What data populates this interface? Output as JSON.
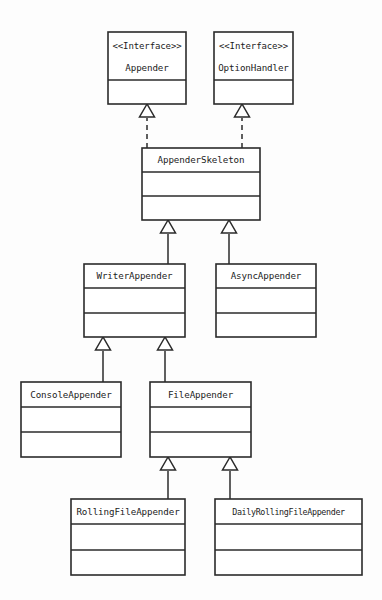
{
  "diagram": {
    "type": "uml-class-diagram",
    "background_color": "#fdfdfd",
    "stroke_color": "#2b2b2b",
    "fill_color": "#ffffff",
    "stereotype_text": "<<Interface>>",
    "nodes": [
      {
        "id": "appender",
        "name": "Appender",
        "kind": "interface",
        "stereotype": "<<Interface>>",
        "x": 108,
        "y": 32,
        "w": 78,
        "h": 72,
        "dividers": [
          48
        ],
        "title_y": 46,
        "name_y": 68
      },
      {
        "id": "option-handler",
        "name": "OptionHandler",
        "kind": "interface",
        "stereotype": "<<Interface>>",
        "x": 214,
        "y": 32,
        "w": 79,
        "h": 72,
        "dividers": [
          48
        ],
        "title_y": 46,
        "name_y": 68
      },
      {
        "id": "appender-skeleton",
        "name": "AppenderSkeleton",
        "kind": "class",
        "stereotype": "",
        "x": 142,
        "y": 148,
        "w": 118,
        "h": 72,
        "dividers": [
          24,
          48
        ],
        "title_y": 160,
        "name_y": 160
      },
      {
        "id": "writer-appender",
        "name": "WriterAppender",
        "kind": "class",
        "stereotype": "",
        "x": 84,
        "y": 264,
        "w": 101,
        "h": 73,
        "dividers": [
          24,
          49
        ],
        "title_y": 276,
        "name_y": 276
      },
      {
        "id": "async-appender",
        "name": "AsyncAppender",
        "kind": "class",
        "stereotype": "",
        "x": 216,
        "y": 264,
        "w": 100,
        "h": 73,
        "dividers": [
          24,
          49
        ],
        "title_y": 276,
        "name_y": 276
      },
      {
        "id": "console-appender",
        "name": "ConsoleAppender",
        "kind": "class",
        "stereotype": "",
        "x": 21,
        "y": 382,
        "w": 100,
        "h": 75,
        "dividers": [
          25,
          50
        ],
        "title_y": 395,
        "name_y": 395
      },
      {
        "id": "file-appender",
        "name": "FileAppender",
        "kind": "class",
        "stereotype": "",
        "x": 150,
        "y": 382,
        "w": 101,
        "h": 75,
        "dividers": [
          25,
          50
        ],
        "title_y": 395,
        "name_y": 395
      },
      {
        "id": "rolling-file-appender",
        "name": "RollingFileAppender",
        "kind": "class",
        "stereotype": "",
        "x": 71,
        "y": 499,
        "w": 114,
        "h": 76,
        "dividers": [
          25,
          51
        ],
        "title_y": 512,
        "name_y": 512
      },
      {
        "id": "daily-rolling-file-appender",
        "name": "DailyRollingFileAppender",
        "kind": "class",
        "stereotype": "",
        "x": 215,
        "y": 499,
        "w": 147,
        "h": 76,
        "dividers": [
          25,
          51
        ],
        "title_y": 512,
        "name_y": 512
      }
    ],
    "edges": [
      {
        "id": "appender-skeleton-implements-appender",
        "from": "appender-skeleton",
        "to": "appender",
        "relation": "realization",
        "style": "dashed",
        "arrow": "hollow-triangle",
        "x": 147,
        "tip_y": 104,
        "line_from_y": 148,
        "line_to_y": 118
      },
      {
        "id": "appender-skeleton-implements-option-handler",
        "from": "appender-skeleton",
        "to": "option-handler",
        "relation": "realization",
        "style": "dashed",
        "arrow": "hollow-triangle",
        "x": 242,
        "tip_y": 104,
        "line_from_y": 148,
        "line_to_y": 118
      },
      {
        "id": "writer-appender-extends-appender-skeleton",
        "from": "writer-appender",
        "to": "appender-skeleton",
        "relation": "generalization",
        "style": "solid",
        "arrow": "hollow-triangle",
        "x": 168,
        "tip_y": 220,
        "line_from_y": 264,
        "line_to_y": 234
      },
      {
        "id": "async-appender-extends-appender-skeleton",
        "from": "async-appender",
        "to": "appender-skeleton",
        "relation": "generalization",
        "style": "solid",
        "arrow": "hollow-triangle",
        "x": 229,
        "tip_y": 220,
        "line_from_y": 264,
        "line_to_y": 234
      },
      {
        "id": "console-appender-extends-writer-appender",
        "from": "console-appender",
        "to": "writer-appender",
        "relation": "generalization",
        "style": "solid",
        "arrow": "hollow-triangle",
        "x": 103,
        "tip_y": 337,
        "line_from_y": 382,
        "line_to_y": 351
      },
      {
        "id": "file-appender-extends-writer-appender",
        "from": "file-appender",
        "to": "writer-appender",
        "relation": "generalization",
        "style": "solid",
        "arrow": "hollow-triangle",
        "x": 165,
        "tip_y": 337,
        "line_from_y": 382,
        "line_to_y": 351
      },
      {
        "id": "rolling-file-appender-extends-file-appender",
        "from": "rolling-file-appender",
        "to": "file-appender",
        "relation": "generalization",
        "style": "solid",
        "arrow": "hollow-triangle",
        "x": 168,
        "tip_y": 457,
        "line_from_y": 499,
        "line_to_y": 471
      },
      {
        "id": "daily-rolling-file-appender-extends-file-appender",
        "from": "daily-rolling-file-appender",
        "to": "file-appender",
        "relation": "generalization",
        "style": "solid",
        "arrow": "hollow-triangle",
        "x": 230,
        "tip_y": 457,
        "line_from_y": 499,
        "line_to_y": 471
      }
    ]
  }
}
